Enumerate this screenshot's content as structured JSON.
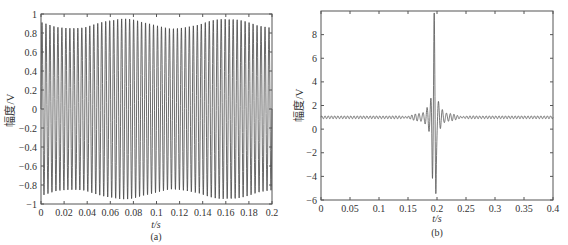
{
  "chart_data": [
    {
      "type": "line",
      "panel_label": "(a)",
      "title": "",
      "xlabel": "t/s",
      "ylabel": "幅度/V",
      "xlim": [
        0,
        0.2
      ],
      "ylim": [
        -1,
        1
      ],
      "xticks": [
        "0",
        "0.02",
        "0.04",
        "0.06",
        "0.08",
        "0.1",
        "0.12",
        "0.14",
        "0.16",
        "0.18",
        "0.2"
      ],
      "yticks": [
        "1",
        "0.8",
        "0.6",
        "0.4",
        "0.2",
        "0",
        "-0.2",
        "-0.4",
        "-0.6",
        "-0.8",
        "-1"
      ],
      "grid": false,
      "description": "Dense oscillating sinusoid-like signal of amplitude ~1 V across the full 0-0.2 s span",
      "signal": {
        "amplitude": 0.95,
        "cycles": 58,
        "envelope_min": 0.85
      },
      "line_color": "#444444"
    },
    {
      "type": "line",
      "panel_label": "(b)",
      "title": "",
      "xlabel": "t/s",
      "ylabel": "幅度/V",
      "xlim": [
        0,
        0.4
      ],
      "ylim": [
        -6,
        10
      ],
      "xticks": [
        "0",
        "0.05",
        "0.1",
        "0.15",
        "0.2",
        "0.25",
        "0.3",
        "0.35",
        "0.4"
      ],
      "yticks": [
        "8",
        "6",
        "4",
        "2",
        "0",
        "-2",
        "-4",
        "-6"
      ],
      "grid": false,
      "description": "Flat baseline near 1 V with a sharp pulse centered at ~0.195 s: peak ~8.3 V, trough ~-5 V, with decaying ringing on both sides",
      "signal": {
        "baseline": 1.0,
        "peak_t": 0.195,
        "peak_value": 8.3,
        "trough_value": -5.0,
        "side_lobe": 2.5
      },
      "line_color": "#555555"
    }
  ]
}
